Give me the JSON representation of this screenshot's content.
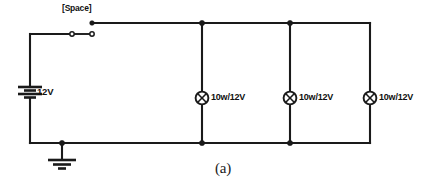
{
  "figure": {
    "caption": "(a)",
    "background_color": "#ffffff",
    "line_color": "#1a1a1a"
  },
  "circuit": {
    "source": {
      "name": "battery",
      "label": "12V",
      "symbol": "battery-multicell",
      "position": "left-branch"
    },
    "switch": {
      "name": "push-switch",
      "label": "[Space]",
      "symbol": "normally-open-contact",
      "state": "open",
      "position": "top-left-branch"
    },
    "ground": {
      "name": "earth-ground",
      "symbol": "earth-ground",
      "position": "bottom-left"
    },
    "lamps": [
      {
        "id": "lamp-1",
        "label": "10w/12V",
        "symbol": "lamp-cross-in-circle"
      },
      {
        "id": "lamp-2",
        "label": "10w/12V",
        "symbol": "lamp-cross-in-circle"
      },
      {
        "id": "lamp-3",
        "label": "10w/12V",
        "symbol": "lamp-cross-in-circle"
      }
    ]
  }
}
